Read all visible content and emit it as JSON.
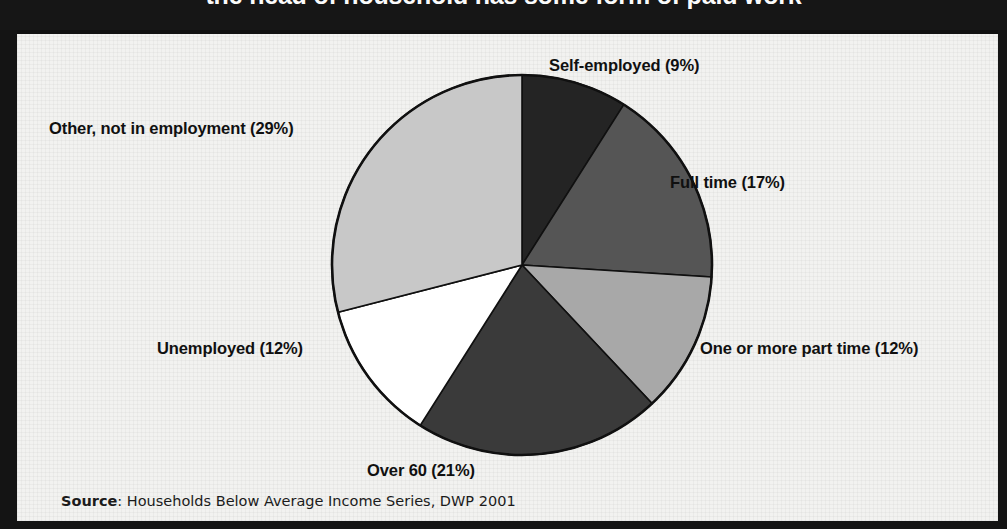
{
  "title": "the head of household has some form of paid work",
  "source": {
    "lead": "Source",
    "text": ": Households Below Average Income Series, DWP 2001"
  },
  "colors": {
    "self_employed": "#242424",
    "full_time": "#555555",
    "part_time": "#a8a8a8",
    "over_60": "#3a3a3a",
    "unemployed": "#ffffff",
    "other": "#c8c8c8",
    "outline": "#101010",
    "band": "#161616",
    "paper": "#f2f2f0"
  },
  "labels": {
    "self_employed": "Self-employed (9%)",
    "full_time": "Full time (17%)",
    "part_time": "One or more part time (12%)",
    "over_60": "Over 60 (21%)",
    "unemployed": "Unemployed (12%)",
    "other": "Other, not in employment (29%)"
  },
  "chart_data": {
    "type": "pie",
    "title": "the head of household has some form of paid work",
    "xlabel": "",
    "ylabel": "",
    "legend": "none",
    "grid": false,
    "start_angle_deg": 0,
    "direction": "clockwise",
    "unit": "percent",
    "categories": [
      "Self-employed",
      "Full time",
      "One or more part time",
      "Over 60",
      "Unemployed",
      "Other, not in employment"
    ],
    "values": [
      9,
      17,
      12,
      21,
      12,
      29
    ],
    "slice_labels": [
      "Self-employed (9%)",
      "Full time (17%)",
      "One or more part time (12%)",
      "Over 60 (21%)",
      "Unemployed (12%)",
      "Other, not in employment (29%)"
    ],
    "slice_colors": [
      "#242424",
      "#555555",
      "#a8a8a8",
      "#3a3a3a",
      "#ffffff",
      "#c8c8c8"
    ],
    "total": 100,
    "annotations": [
      "Source: Households Below Average Income Series, DWP 2001"
    ]
  }
}
